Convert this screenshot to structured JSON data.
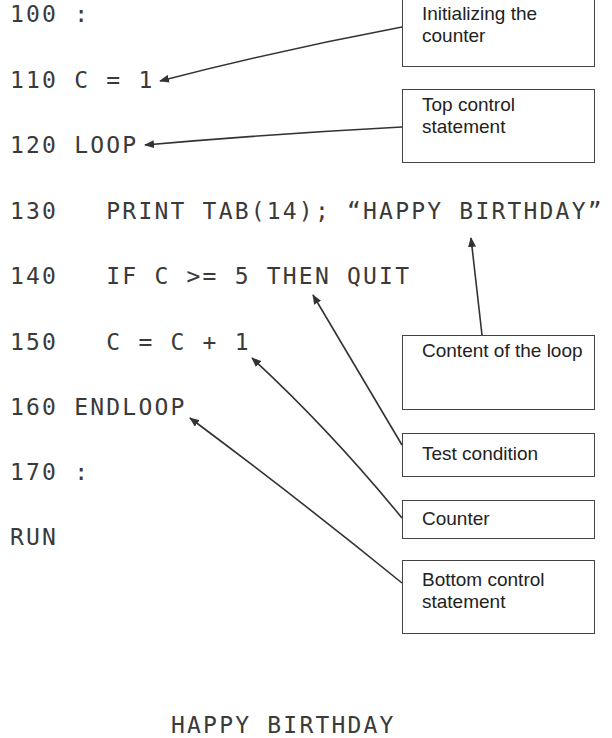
{
  "program": {
    "lines": [
      {
        "number": "100",
        "code": " :"
      },
      {
        "number": "110",
        "code": " C = 1"
      },
      {
        "number": "120",
        "code": " LOOP"
      },
      {
        "number": "130",
        "code": "   PRINT TAB(14); “HAPPY BIRTHDAY”"
      },
      {
        "number": "140",
        "code": "   IF C >= 5 THEN QUIT"
      },
      {
        "number": "150",
        "code": "   C = C + 1"
      },
      {
        "number": "160",
        "code": " ENDLOOP"
      },
      {
        "number": "170",
        "code": " :"
      },
      {
        "number": "",
        "code": "RUN"
      }
    ]
  },
  "callouts": [
    {
      "label": "Initializing the counter",
      "target_line": "110"
    },
    {
      "label": "Top control statement",
      "target_line": "120"
    },
    {
      "label": "Content of the loop",
      "target_line": "130"
    },
    {
      "label": "Test condition",
      "target_line": "140"
    },
    {
      "label": "Counter",
      "target_line": "150"
    },
    {
      "label": "Bottom control statement",
      "target_line": "160"
    }
  ],
  "output": {
    "text": "HAPPY BIRTHDAY"
  },
  "colors": {
    "text": "#3a3a3a",
    "lines": "#333333",
    "box_border": "#444444"
  }
}
